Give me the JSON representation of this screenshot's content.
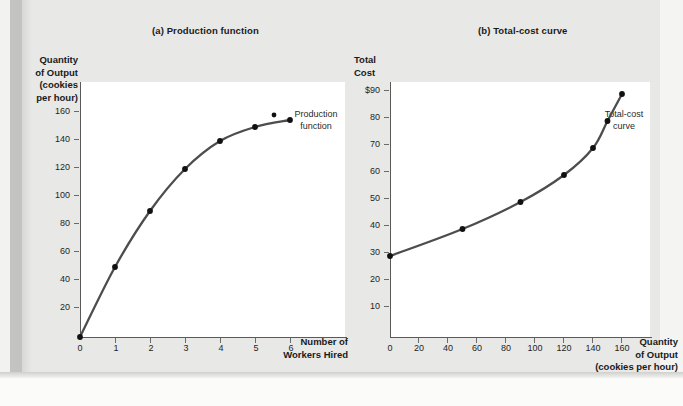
{
  "figure": {
    "background_color": "#e8e8e6",
    "curve_color": "#4d4d4d",
    "axis_color": "#5a5a5a"
  },
  "panels": [
    {
      "key": "a",
      "title": "(a) Production function",
      "ylabel_lines": [
        "Quantity",
        "of Output",
        "(cookies",
        "per hour)"
      ],
      "xlabel_lines": [
        "Number of",
        "Workers Hired"
      ],
      "curve_label_lines": [
        "Production",
        "function"
      ]
    },
    {
      "key": "b",
      "title": "(b) Total-cost curve",
      "ylabel_lines": [
        "Total",
        "Cost"
      ],
      "xlabel_lines": [
        "Quantity",
        "of Output",
        "(cookies per hour)"
      ],
      "curve_label_lines": [
        "Total-cost",
        "curve"
      ]
    }
  ],
  "chart_data": [
    {
      "type": "line",
      "title": "(a) Production function",
      "xlabel": "Number of Workers Hired",
      "ylabel": "Quantity of Output (cookies per hour)",
      "xlim": [
        0,
        6.6
      ],
      "ylim": [
        0,
        172
      ],
      "xticks": [
        0,
        1,
        2,
        3,
        4,
        5,
        6
      ],
      "xtick_labels": [
        "0",
        "1",
        "2",
        "3",
        "4",
        "5",
        "6"
      ],
      "yticks": [
        20,
        40,
        60,
        80,
        100,
        120,
        140,
        160
      ],
      "ytick_labels": [
        "20",
        "40",
        "60",
        "80",
        "100",
        "120",
        "140",
        "160"
      ],
      "grid": false,
      "legend": "none",
      "annotations": [
        "Production function"
      ],
      "series": [
        {
          "name": "Production function",
          "x": [
            0,
            1,
            2,
            3,
            4,
            5,
            6
          ],
          "values": [
            0,
            50,
            90,
            120,
            140,
            150,
            155
          ],
          "markers": true
        }
      ]
    },
    {
      "type": "line",
      "title": "(b) Total-cost curve",
      "xlabel": "Quantity of Output (cookies per hour)",
      "ylabel": "Total Cost",
      "xlim": [
        0,
        176
      ],
      "ylim": [
        0,
        99
      ],
      "xticks": [
        0,
        20,
        40,
        60,
        80,
        100,
        120,
        140,
        160
      ],
      "xtick_labels": [
        "0",
        "20",
        "40",
        "60",
        "80",
        "100",
        "120",
        "140",
        "160"
      ],
      "yticks": [
        10,
        20,
        30,
        40,
        50,
        60,
        70,
        80,
        90
      ],
      "ytick_labels": [
        "10",
        "20",
        "30",
        "40",
        "50",
        "60",
        "70",
        "80",
        "$90"
      ],
      "grid": false,
      "legend": "none",
      "annotations": [
        "Total-cost curve"
      ],
      "series": [
        {
          "name": "Total-cost curve",
          "x": [
            0,
            50,
            90,
            120,
            140,
            150,
            160
          ],
          "values": [
            30,
            40,
            50,
            60,
            70,
            80,
            90
          ],
          "markers": true
        }
      ]
    }
  ]
}
